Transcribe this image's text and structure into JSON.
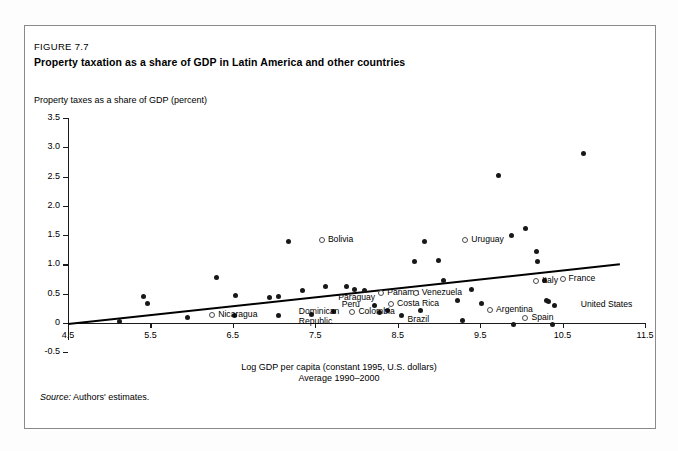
{
  "figure": {
    "number": "FIGURE 7.7",
    "title": "Property taxation as a share of GDP in Latin America and other countries",
    "source_label": "Source:",
    "source_text": "Authors' estimates."
  },
  "chart_data": {
    "type": "scatter",
    "title": "Property taxation as a share of GDP in Latin America and other countries",
    "ylabel": "Property taxes as a share of GDP (percent)",
    "xlabel": "Log GDP per capita (constant 1995, U.S. dollars)",
    "xlabel_line2": "Average 1990–2000",
    "xlim": [
      4.5,
      11.5
    ],
    "ylim": [
      -0.5,
      3.5
    ],
    "xticks": [
      "4.5",
      "5.5",
      "6.5",
      "7.5",
      "8.5",
      "9.5",
      "10.5",
      "11.5"
    ],
    "yticks": [
      "3.5",
      "3.0",
      "2.5",
      "2.0",
      "1.5",
      "1.0",
      "0.5",
      "0",
      "-0.5"
    ],
    "grid": false,
    "legend": "none",
    "marker_color": "#181818",
    "trendline": {
      "x0": 4.5,
      "y0": 0.0,
      "x1": 11.2,
      "y1": 1.02
    },
    "points": [
      {
        "x": 5.12,
        "y": 0.02
      },
      {
        "x": 5.42,
        "y": 0.46
      },
      {
        "x": 5.47,
        "y": 0.33
      },
      {
        "x": 5.95,
        "y": 0.1
      },
      {
        "x": 6.3,
        "y": 0.78
      },
      {
        "x": 6.52,
        "y": 0.13
      },
      {
        "x": 6.53,
        "y": 0.47
      },
      {
        "x": 6.95,
        "y": 0.43
      },
      {
        "x": 7.05,
        "y": 0.45
      },
      {
        "x": 7.05,
        "y": 0.12
      },
      {
        "x": 7.18,
        "y": 1.4
      },
      {
        "x": 7.35,
        "y": 0.55
      },
      {
        "x": 7.45,
        "y": 0.15
      },
      {
        "x": 7.62,
        "y": 0.62
      },
      {
        "x": 7.72,
        "y": 0.2
      },
      {
        "x": 7.88,
        "y": 0.63
      },
      {
        "x": 7.98,
        "y": 0.57
      },
      {
        "x": 8.1,
        "y": 0.55
      },
      {
        "x": 8.22,
        "y": 0.3
      },
      {
        "x": 8.28,
        "y": 0.18
      },
      {
        "x": 8.38,
        "y": 0.22
      },
      {
        "x": 8.55,
        "y": 0.12
      },
      {
        "x": 8.7,
        "y": 1.05
      },
      {
        "x": 8.78,
        "y": 0.22
      },
      {
        "x": 8.82,
        "y": 1.4
      },
      {
        "x": 9.0,
        "y": 1.07
      },
      {
        "x": 9.05,
        "y": 0.72
      },
      {
        "x": 9.22,
        "y": 0.38
      },
      {
        "x": 9.28,
        "y": 0.05
      },
      {
        "x": 9.4,
        "y": 0.57
      },
      {
        "x": 9.52,
        "y": 0.33
      },
      {
        "x": 9.72,
        "y": 2.52
      },
      {
        "x": 9.88,
        "y": 1.5
      },
      {
        "x": 9.9,
        "y": -0.02
      },
      {
        "x": 10.05,
        "y": 1.62
      },
      {
        "x": 10.18,
        "y": 1.22
      },
      {
        "x": 10.2,
        "y": 1.05
      },
      {
        "x": 10.28,
        "y": 0.72
      },
      {
        "x": 10.3,
        "y": 0.38
      },
      {
        "x": 10.33,
        "y": 0.37
      },
      {
        "x": 10.38,
        "y": -0.02
      },
      {
        "x": 10.4,
        "y": 0.3
      },
      {
        "x": 10.75,
        "y": 2.9
      }
    ],
    "labeled_points": [
      {
        "name": "Nicaragua",
        "x": 6.25,
        "y": 0.13,
        "marker": "hollow"
      },
      {
        "name": "Bolivia",
        "x": 7.58,
        "y": 1.42,
        "marker": "hollow"
      },
      {
        "name": "Dominican",
        "x": 7.3,
        "y": 0.18,
        "marker": "none"
      },
      {
        "name": "Republic",
        "x": 7.3,
        "y": 0.02,
        "marker": "none"
      },
      {
        "name": "Paraguay",
        "x": 7.78,
        "y": 0.42,
        "marker": "none"
      },
      {
        "name": "Peru",
        "x": 7.82,
        "y": 0.3,
        "marker": "none"
      },
      {
        "name": "Colombia",
        "x": 7.95,
        "y": 0.18,
        "marker": "hollow"
      },
      {
        "name": "Panama",
        "x": 8.3,
        "y": 0.52,
        "marker": "hollow"
      },
      {
        "name": "Costa Rica",
        "x": 8.42,
        "y": 0.32,
        "marker": "hollow"
      },
      {
        "name": "Venezuela",
        "x": 8.72,
        "y": 0.52,
        "marker": "hollow"
      },
      {
        "name": "Brazil",
        "x": 8.62,
        "y": 0.05,
        "marker": "none"
      },
      {
        "name": "Uruguay",
        "x": 9.32,
        "y": 1.42,
        "marker": "hollow"
      },
      {
        "name": "Argentina",
        "x": 9.62,
        "y": 0.22,
        "marker": "hollow"
      },
      {
        "name": "Spain",
        "x": 10.05,
        "y": 0.08,
        "marker": "hollow"
      },
      {
        "name": "Italy",
        "x": 10.18,
        "y": 0.72,
        "marker": "hollow"
      },
      {
        "name": "France",
        "x": 10.5,
        "y": 0.75,
        "marker": "hollow"
      },
      {
        "name": "United States",
        "x": 10.72,
        "y": 0.3,
        "marker": "none"
      }
    ]
  }
}
